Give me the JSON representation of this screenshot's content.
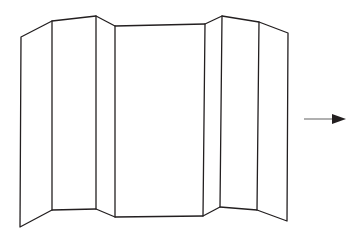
{
  "figure": {
    "background_color": "#ffffff",
    "stroke_color": "#231f20",
    "fill_color": "#ffffff",
    "stroke_width": 1.3,
    "canvas": {
      "width": 360,
      "height": 242
    }
  },
  "panels": [
    {
      "name": "panel-1-left-outer",
      "label": "Panel 1",
      "points": "21,37 52,21 52,210 20,227"
    },
    {
      "name": "panel-2-left-inner",
      "label": "Panel 2",
      "points": "52,21 96,16 96,209 52,210"
    },
    {
      "name": "panel-3-left-center",
      "label": "Panel 3",
      "points": "96,16 115,26 115,217 96,209"
    },
    {
      "name": "panel-4-center",
      "label": "Panel 4",
      "points": "115,26 205,24 203,216 115,217"
    },
    {
      "name": "panel-5-right-center",
      "label": "Panel 5",
      "points": "205,24 222,16 220,207 203,216"
    },
    {
      "name": "panel-6-right-inner",
      "label": "Panel 6",
      "points": "222,16 259,22 257,210 220,207"
    },
    {
      "name": "panel-7-right-outer",
      "label": "Panel 7",
      "points": "259,22 288,33 287,221 257,210"
    }
  ],
  "fold_lines": [
    {
      "name": "fold-line-1",
      "x1": 52,
      "y1": 21,
      "x2": 52,
      "y2": 210
    },
    {
      "name": "fold-line-2",
      "x1": 96,
      "y1": 16,
      "x2": 96,
      "y2": 209
    },
    {
      "name": "fold-line-3",
      "x1": 115,
      "y1": 26,
      "x2": 115,
      "y2": 217
    },
    {
      "name": "fold-line-4",
      "x1": 205,
      "y1": 24,
      "x2": 203,
      "y2": 216
    },
    {
      "name": "fold-line-5",
      "x1": 222,
      "y1": 16,
      "x2": 220,
      "y2": 207
    },
    {
      "name": "fold-line-6",
      "x1": 259,
      "y1": 22,
      "x2": 257,
      "y2": 210
    }
  ],
  "outline": {
    "name": "panel-outline",
    "points": "21,37 52,21 96,16 115,26 205,24 222,16 259,22 288,33 287,221 257,210 220,207 203,216 115,217 96,209 52,210 20,227"
  },
  "edges": {
    "left_edge": {
      "name": "edge-left",
      "x1": 21,
      "y1": 37,
      "x2": 20,
      "y2": 227
    },
    "right_edge": {
      "name": "edge-right",
      "x1": 288,
      "y1": 33,
      "x2": 287,
      "y2": 221
    }
  },
  "arrow": {
    "name": "direction-arrow",
    "direction": "right",
    "shaft_color": "#7b7b7b",
    "head_color": "#231f20",
    "shaft": {
      "x1": 304,
      "y1": 119,
      "x2": 336,
      "y2": 119
    },
    "head_points": "332,114 346,119 332,124",
    "stroke_width": 1.2
  }
}
